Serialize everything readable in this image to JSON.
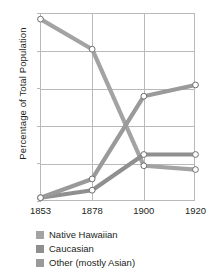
{
  "chart_data": {
    "type": "line",
    "title": "",
    "xlabel": "",
    "ylabel": "Percentage of Total Population",
    "categories": [
      "1853",
      "1878",
      "1900",
      "1920"
    ],
    "x_tick_labels": [
      "1853",
      "1878",
      "1900",
      "1920"
    ],
    "y_tick_labels": [
      "0",
      "20",
      "40",
      "60",
      "80",
      "100"
    ],
    "y_ticks": [
      0,
      20,
      40,
      60,
      80,
      100
    ],
    "ylim": [
      0,
      100
    ],
    "grid": true,
    "legend_position": "bottom-left",
    "marker": "open-circle",
    "series": [
      {
        "name": "Native Hawaiian",
        "color": "#a3a3a3",
        "values": [
          97,
          81,
          19,
          17
        ]
      },
      {
        "name": "Caucasian",
        "color": "#8f8f8f",
        "values": [
          2,
          6,
          25,
          25
        ]
      },
      {
        "name": "Other (mostly Asian)",
        "color": "#9a9a9a",
        "values": [
          2,
          12,
          56,
          62
        ]
      }
    ]
  },
  "axis": {
    "y_title": "Percentage of Total Population",
    "y_labels": [
      "100",
      "80",
      "60",
      "40",
      "20",
      "0"
    ],
    "x_labels": [
      "1853",
      "1878",
      "1900",
      "1920"
    ]
  },
  "legend": {
    "items": [
      {
        "label": "Native Hawaiian",
        "color": "#a3a3a3"
      },
      {
        "label": "Caucasian",
        "color": "#8f8f8f"
      },
      {
        "label": "Other (mostly Asian)",
        "color": "#9a9a9a"
      }
    ]
  },
  "colors": {
    "grid": "#b9b9b9",
    "frame": "#b9b9b9",
    "text": "#231f20",
    "background": "#ffffff",
    "marker_fill": "#ffffff",
    "marker_stroke": "#6f6f6f"
  }
}
